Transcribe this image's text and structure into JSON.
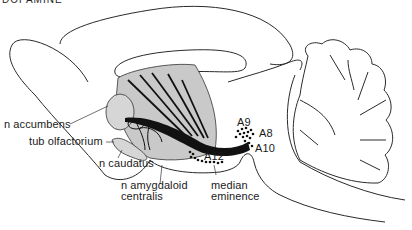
{
  "figure": {
    "title_cropped": "DOPAMINE",
    "labels": {
      "accumbens": "n accumbens",
      "olfactorium": "tub olfactorium",
      "caudatus": "n caudatus",
      "amygdaloid_line1": "n amygdaloid",
      "amygdaloid_line2": "centralis",
      "median_line1": "median",
      "median_line2": "eminence",
      "a9": "A9",
      "a8": "A8",
      "a10": "A10",
      "a12": "A12"
    },
    "colors": {
      "outline": "#2a2a2a",
      "striatum_fill": "#c9c9c9",
      "pathway": "#111111",
      "background": "#ffffff"
    }
  }
}
